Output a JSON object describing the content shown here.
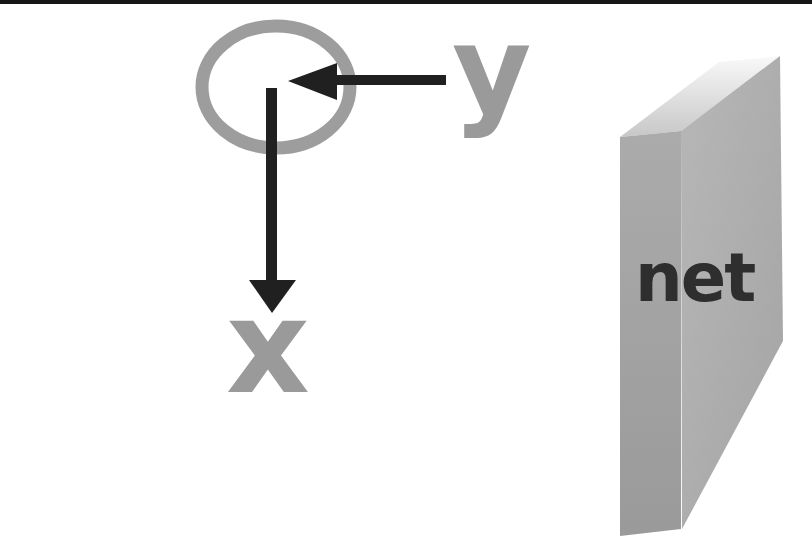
{
  "figure": {
    "labels": {
      "y_axis": "y",
      "x_axis": "x",
      "net_box": "net"
    },
    "colors": {
      "background": "#ffffff",
      "top_rule": "#161616",
      "axis_label_gray": "#9a9a9a",
      "origin_ring_gray": "#9d9d9d",
      "arrow_black": "#202020",
      "box_front_light": "#b7b7b7",
      "box_front_dark": "#a4a4a4",
      "box_side_light": "#ababab",
      "box_side_dark": "#9a9a9a",
      "box_top_light": "#f9f9f9",
      "box_top_dark": "#c7c7c7",
      "net_text": "#2e2e2e"
    }
  }
}
